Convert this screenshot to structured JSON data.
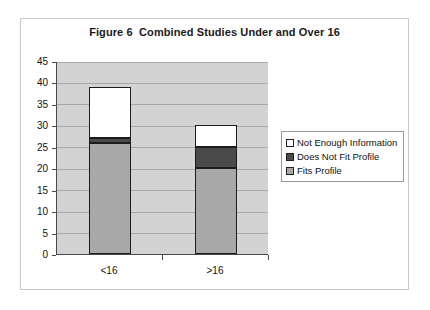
{
  "chart_data": {
    "type": "bar",
    "subtype": "stacked-bar",
    "title": "Figure 6  Combined Studies Under and Over 16",
    "xlabel": "",
    "ylabel": "",
    "categories": [
      "<16",
      ">16"
    ],
    "ylim": [
      0,
      45
    ],
    "ytick_step": 5,
    "yticks": [
      0,
      5,
      10,
      15,
      20,
      25,
      30,
      35,
      40,
      45
    ],
    "ytick_labels": [
      "0",
      "5",
      "10",
      "15",
      "20",
      "25",
      "30",
      "35",
      "40",
      "45"
    ],
    "grid": true,
    "grid_axis": "y",
    "legend_position": "right",
    "plot_background": "#d3d3d3",
    "series": [
      {
        "name": "Fits Profile",
        "color": "#a8a8a8",
        "values": [
          26,
          20
        ]
      },
      {
        "name": "Does Not Fit Profile",
        "color": "#4a4a4a",
        "values": [
          1,
          5
        ]
      },
      {
        "name": "Not Enough Information",
        "color": "#ffffff",
        "values": [
          12,
          5
        ]
      }
    ],
    "totals": [
      39,
      30
    ],
    "stack_order_bottom_to_top": [
      "Fits Profile",
      "Does Not Fit Profile",
      "Not Enough Information"
    ]
  },
  "legend": {
    "entries": [
      {
        "label": "Not Enough Information",
        "color": "#ffffff"
      },
      {
        "label": "Does Not Fit Profile",
        "color": "#4a4a4a"
      },
      {
        "label": "Fits Profile",
        "color": "#a8a8a8"
      }
    ]
  }
}
